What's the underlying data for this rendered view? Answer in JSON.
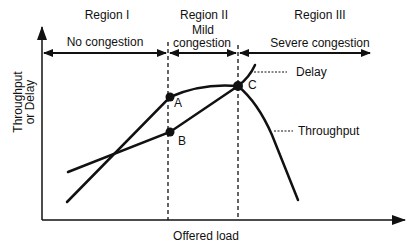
{
  "diagram": {
    "type": "congestion-regions",
    "axes": {
      "x_label": "Offered load",
      "y_label_line1": "Throughput",
      "y_label_line2": "or Delay"
    },
    "regions": [
      {
        "name": "Region I",
        "description": "No congestion"
      },
      {
        "name": "Region II",
        "description_line1": "Mild",
        "description_line2": "congestion"
      },
      {
        "name": "Region III",
        "description": "Severe congestion"
      }
    ],
    "points": [
      {
        "label": "A"
      },
      {
        "label": "B"
      },
      {
        "label": "C"
      }
    ],
    "curves": [
      {
        "label": "Delay"
      },
      {
        "label": "Throughput"
      }
    ],
    "colors": {
      "ink": "#111111",
      "background": "#ffffff"
    }
  }
}
